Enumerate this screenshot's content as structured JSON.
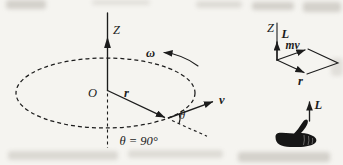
{
  "figure": {
    "paper_color": "#f5f4f0",
    "ink_color": "#1c1c1c",
    "orbit_diagram": {
      "z_axis_label": "Z",
      "angular_velocity_label": "ω",
      "origin_label": "O",
      "position_vector_label": "r",
      "velocity_vector_label": "v",
      "angle_label": "θ",
      "angle_value_text": "θ = 90°"
    },
    "cross_product_diagram": {
      "z_axis_label": "Z",
      "angular_momentum_label": "L",
      "momentum_label": "mv",
      "position_vector_label": "r"
    },
    "right_hand_rule_diagram": {
      "angular_momentum_label": "L"
    }
  }
}
